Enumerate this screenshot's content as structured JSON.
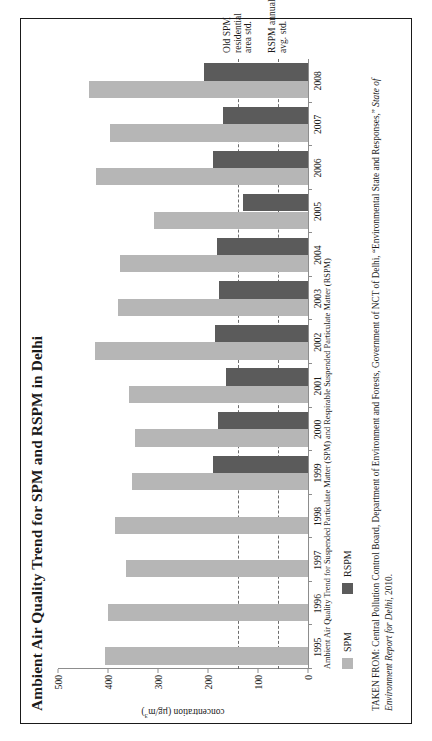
{
  "figure": {
    "title": "Ambient Air Quality Trend for SPM and RSPM in Delhi",
    "sub_caption": "Ambient Air Quality Trend for Suspended Particulate Matter (SPM) and Respirable Suspended Particulate Matter (RSPM)",
    "source_prefix": "TAKEN FROM: Central Pollution Control Board, Department of Environment and Forests, Government of NCT of Delhi, “Environmental State and Responses,” ",
    "source_italic": "State of Environment Report for Delhi",
    "source_suffix": ", 2010."
  },
  "legend": {
    "items": [
      {
        "label": "SPM",
        "color": "#b6b6b6"
      },
      {
        "label": "RSPM",
        "color": "#5b5b5b"
      }
    ]
  },
  "annotations": {
    "std_spm": "Old SPM\nresidential\narea std.",
    "std_spm_line1": "Old SPM",
    "std_spm_line2": "residential",
    "std_spm_line3": "area std.",
    "std_rspm_line1": "RSPM annual",
    "std_rspm_line2": "avg. std."
  },
  "chart_data": {
    "type": "bar",
    "title": "Ambient Air Quality Trend for SPM and RSPM in Delhi",
    "subtitle": "Ambient Air Quality Trend for Suspended Particulate Matter (SPM) and Respirable Suspended Particulate Matter (RSPM)",
    "orientation": "vertical",
    "xlabel": "",
    "ylabel": "concentration (µg/m³)",
    "ylim": [
      0,
      500
    ],
    "yticks": [
      0,
      100,
      200,
      300,
      400,
      500
    ],
    "ytick_labels": [
      "0",
      "100",
      "200",
      "300",
      "400",
      "500"
    ],
    "grid": false,
    "legend_position": "below-left",
    "categories": [
      "1995",
      "1996",
      "1997",
      "1998",
      "1999",
      "2000",
      "2001",
      "2002",
      "2003",
      "2004",
      "2005",
      "2006",
      "2007",
      "2008"
    ],
    "series": [
      {
        "name": "SPM",
        "color": "#b6b6b6",
        "values": [
          407,
          400,
          365,
          387,
          352,
          347,
          358,
          427,
          380,
          377,
          309,
          425,
          396,
          438
        ]
      },
      {
        "name": "RSPM",
        "color": "#5b5b5b",
        "values": [
          null,
          null,
          null,
          null,
          190,
          180,
          164,
          186,
          178,
          183,
          131,
          191,
          171,
          208
        ]
      }
    ],
    "reference_lines": [
      {
        "label": "Old SPM residential area std.",
        "value": 140,
        "style": "dashed",
        "color": "#6d6d6d"
      },
      {
        "label": "RSPM annual avg. std.",
        "value": 60,
        "style": "dashed",
        "color": "#6d6d6d"
      }
    ]
  }
}
